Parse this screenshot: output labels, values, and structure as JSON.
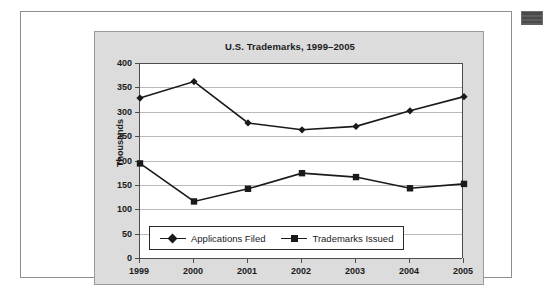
{
  "figure": {
    "corner_marker_name": "page-corner-marker"
  },
  "chart_data": {
    "type": "line",
    "title": "U.S. Trademarks, 1999–2005",
    "xlabel": "",
    "ylabel": "Thousands",
    "categories": [
      "1999",
      "2000",
      "2001",
      "2002",
      "2003",
      "2004",
      "2005"
    ],
    "ylim": [
      0,
      400
    ],
    "yticks": [
      0,
      50,
      100,
      150,
      200,
      250,
      300,
      350,
      400
    ],
    "ytick_labels": [
      "0",
      "50",
      "100",
      "150",
      "200",
      "250",
      "300",
      "350",
      "400"
    ],
    "grid": true,
    "legend_position": "inside-bottom-left",
    "series": [
      {
        "name": "Applications Filed",
        "marker": "diamond",
        "color": "#1a1a1a",
        "values": [
          328,
          362,
          277,
          263,
          270,
          302,
          331
        ]
      },
      {
        "name": "Trademarks Issued",
        "marker": "square",
        "color": "#1a1a1a",
        "values": [
          194,
          116,
          142,
          174,
          166,
          143,
          152
        ]
      }
    ]
  }
}
